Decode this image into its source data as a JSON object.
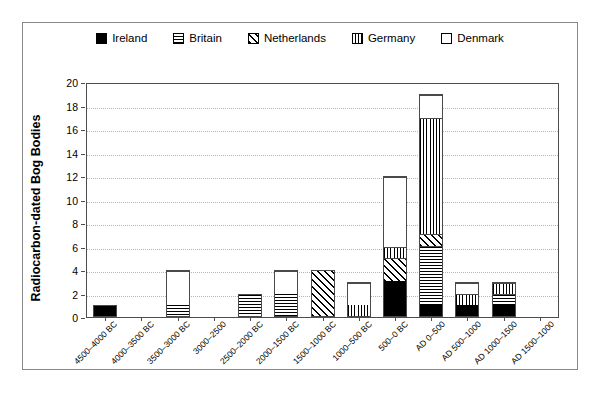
{
  "chart_data": {
    "type": "bar",
    "subtype": "stacked-bar",
    "title": "",
    "xlabel": "",
    "ylabel": "Radiocarbon-dated Bog Bodies",
    "ylim": [
      0,
      20
    ],
    "ytick_step": 2,
    "yticks": [
      0,
      2,
      4,
      6,
      8,
      10,
      12,
      14,
      16,
      18,
      20
    ],
    "grid": "horizontal-dotted",
    "legend_position": "top-center",
    "categories": [
      "4500–4000 BC",
      "4000–3500 BC",
      "3500–3000 BC",
      "3000–2500",
      "2500–2000 BC",
      "2000–1500 BC",
      "1500–1000 BC",
      "1000–500 BC",
      "500–0 BC",
      "AD 0–500",
      "AD 500–1000",
      "AD 1000–1500",
      "AD 1500–1000"
    ],
    "series": [
      {
        "name": "Ireland",
        "pattern": "solid-black",
        "values": [
          1,
          0,
          0,
          0,
          0,
          0,
          0,
          0,
          3,
          1,
          1,
          1,
          0
        ]
      },
      {
        "name": "Britain",
        "pattern": "horizontal-lines",
        "values": [
          0,
          0,
          1,
          0,
          2,
          2,
          0,
          0,
          0,
          5,
          0,
          1,
          0
        ]
      },
      {
        "name": "Netherlands",
        "pattern": "diagonal-hatch",
        "values": [
          0,
          0,
          0,
          0,
          0,
          0,
          4,
          0,
          2,
          1,
          0,
          0,
          0
        ]
      },
      {
        "name": "Germany",
        "pattern": "vertical-lines",
        "values": [
          0,
          0,
          0,
          0,
          0,
          0,
          0,
          1,
          1,
          10,
          1,
          1,
          0
        ]
      },
      {
        "name": "Denmark",
        "pattern": "white-empty",
        "values": [
          0,
          0,
          3,
          0,
          0,
          2,
          0,
          2,
          6,
          2,
          1,
          0,
          0
        ]
      }
    ],
    "totals": [
      1,
      0,
      4,
      0,
      2,
      4,
      4,
      3,
      12,
      19,
      3,
      3,
      0
    ],
    "colors": {
      "axis": "#4d4d4d",
      "grid": "#b4b4b4",
      "bar_outline": "#4a4a4a",
      "fill_black": "#000000",
      "fill_white": "#ffffff",
      "frame": "#8a8a8a"
    }
  },
  "legend": {
    "items": [
      {
        "label": "Ireland",
        "swatch": "solid-black-swatch"
      },
      {
        "label": "Britain",
        "swatch": "horizontal-lines-swatch"
      },
      {
        "label": "Netherlands",
        "swatch": "diagonal-hatch-swatch"
      },
      {
        "label": "Germany",
        "swatch": "vertical-lines-swatch"
      },
      {
        "label": "Denmark",
        "swatch": "white-empty-swatch"
      }
    ]
  }
}
